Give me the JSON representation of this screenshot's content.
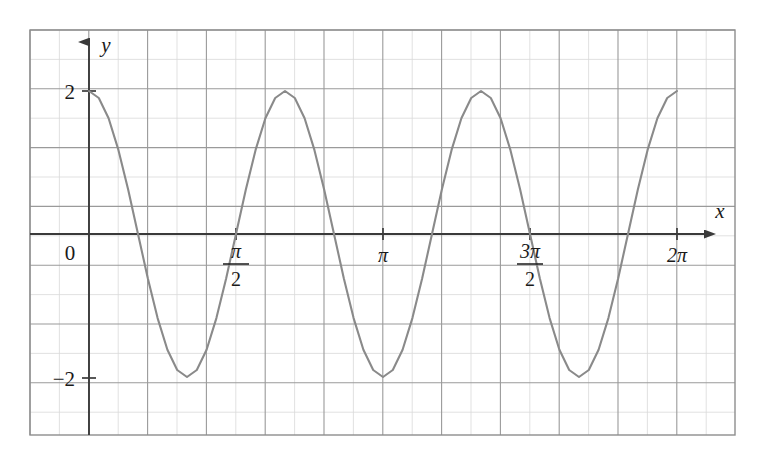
{
  "figure": {
    "background_color": "#ffffff",
    "grid": {
      "minor_color": "#d9d9d9",
      "major_color": "#9a9a9a",
      "border_color": "#8d8d8d",
      "left_px": 30,
      "top_px": 30,
      "right_px": 735,
      "bottom_px": 435,
      "minor_step_px": 29.4,
      "major_every": 2,
      "visible": true
    },
    "axes": {
      "axis_color": "#3a3a3a",
      "origin_px": {
        "x": 89,
        "y": 234
      },
      "x_axis_label": "x",
      "y_axis_label": "y",
      "x_arrow": true,
      "y_arrow": true,
      "origin_label": "0"
    },
    "curve": {
      "color": "#8a8a8a",
      "stroke_width": 2.1
    }
  },
  "chart_data": {
    "type": "line",
    "title": "",
    "xlabel": "x",
    "ylabel": "y",
    "grid": true,
    "legend": null,
    "function": "y = 2cos(3x)",
    "amplitude": 2,
    "period": "2π/3",
    "xlim": [
      -0.2,
      7.1
    ],
    "ylim": [
      -2.85,
      2.85
    ],
    "x_ticks": [
      {
        "value": 0,
        "label": "0",
        "kind": "plain",
        "px": 89
      },
      {
        "value": 1.5707963,
        "label": "π/2",
        "kind": "fraction",
        "numerator": "π",
        "denominator": "2",
        "px": 236
      },
      {
        "value": 3.1415927,
        "label": "π",
        "kind": "plain-pi",
        "px": 383
      },
      {
        "value": 4.712389,
        "label": "3π/2",
        "kind": "fraction",
        "numerator": "3π",
        "denominator": "2",
        "px": 530
      },
      {
        "value": 6.2831853,
        "label": "2π",
        "kind": "plain-pi",
        "px": 677
      }
    ],
    "y_ticks": [
      {
        "value": 2,
        "label": "2",
        "px": 91
      },
      {
        "value": -2,
        "label": "−2",
        "px": 378
      }
    ],
    "maxima": [
      {
        "x": 0,
        "y": 2
      },
      {
        "x": 2.0943951,
        "y": 2
      },
      {
        "x": 4.1887902,
        "y": 2
      },
      {
        "x": 6.2831853,
        "y": 2
      }
    ],
    "minima": [
      {
        "x": 1.0471976,
        "y": -2
      },
      {
        "x": 3.1415927,
        "y": -2
      },
      {
        "x": 5.2359878,
        "y": -2
      }
    ],
    "zero_crossings": [
      0.5235988,
      1.5707963,
      2.6179939,
      3.6651914,
      4.712389,
      5.7595865
    ],
    "x_samples": [
      0,
      0.1047,
      0.2094,
      0.3142,
      0.4189,
      0.5236,
      0.6283,
      0.733,
      0.8378,
      0.9425,
      1.0472,
      1.1519,
      1.2566,
      1.3614,
      1.4661,
      1.5708,
      1.6755,
      1.7802,
      1.885,
      1.9897,
      2.0944,
      2.1991,
      2.3038,
      2.4086,
      2.5133,
      2.618,
      2.7227,
      2.8274,
      2.9322,
      3.0369,
      3.1416,
      3.2463,
      3.351,
      3.4558,
      3.5605,
      3.6652,
      3.7699,
      3.8746,
      3.9794,
      4.0841,
      4.1888,
      4.2935,
      4.3982,
      4.503,
      4.6077,
      4.7124,
      4.8171,
      4.9218,
      5.0265,
      5.1313,
      5.236,
      5.3407,
      5.4454,
      5.5501,
      5.6549,
      5.7596,
      5.8643,
      5.969,
      6.0737,
      6.1785,
      6.2832
    ],
    "y_samples": [
      2,
      1.902,
      1.618,
      1.176,
      0.618,
      0,
      -0.618,
      -1.176,
      -1.618,
      -1.902,
      -2,
      -1.902,
      -1.618,
      -1.176,
      -0.618,
      0,
      0.618,
      1.176,
      1.618,
      1.902,
      2,
      1.902,
      1.618,
      1.176,
      0.618,
      0,
      -0.618,
      -1.176,
      -1.618,
      -1.902,
      -2,
      -1.902,
      -1.618,
      -1.176,
      -0.618,
      0,
      0.618,
      1.176,
      1.618,
      1.902,
      2,
      1.902,
      1.618,
      1.176,
      0.618,
      0,
      -0.618,
      -1.176,
      -1.618,
      -1.902,
      -2,
      -1.902,
      -1.618,
      -1.176,
      -0.618,
      0,
      0.618,
      1.176,
      1.618,
      1.902,
      2
    ]
  }
}
